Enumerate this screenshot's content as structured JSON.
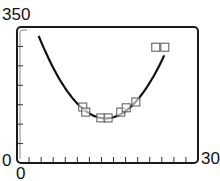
{
  "chart_data": {
    "type": "scatter",
    "title": "",
    "xlabel": "",
    "ylabel": "",
    "xlim": [
      0,
      30
    ],
    "ylim": [
      0,
      350
    ],
    "x_tick_labels": [
      "0",
      "30"
    ],
    "y_tick_labels": [
      "0",
      "350"
    ],
    "x_ticks_count": 15,
    "y_ticks_count": 7,
    "grid": false,
    "legend": [],
    "series": [
      {
        "name": "data",
        "kind": "scatter",
        "marker": "square",
        "x": [
          10.9,
          11.4,
          13.9,
          15.1,
          17.2,
          18.1,
          19.7,
          23.0,
          24.5
        ],
        "y": [
          144,
          131,
          116,
          116,
          131,
          142,
          157,
          298,
          298
        ]
      },
      {
        "name": "quadratic fit",
        "kind": "line",
        "x": [
          3.8,
          6,
          8,
          10,
          12,
          14,
          16,
          18,
          20,
          22,
          24.2
        ],
        "y": [
          350,
          275,
          213,
          165,
          132,
          116,
          118,
          138,
          176,
          230,
          345
        ]
      }
    ]
  },
  "labels": {
    "y_max": "350",
    "y_min": "0",
    "x_min": "0",
    "x_max": "30"
  },
  "colors": {
    "frame": "#1a1a1a",
    "curve": "#111111",
    "marker": "#555555"
  }
}
